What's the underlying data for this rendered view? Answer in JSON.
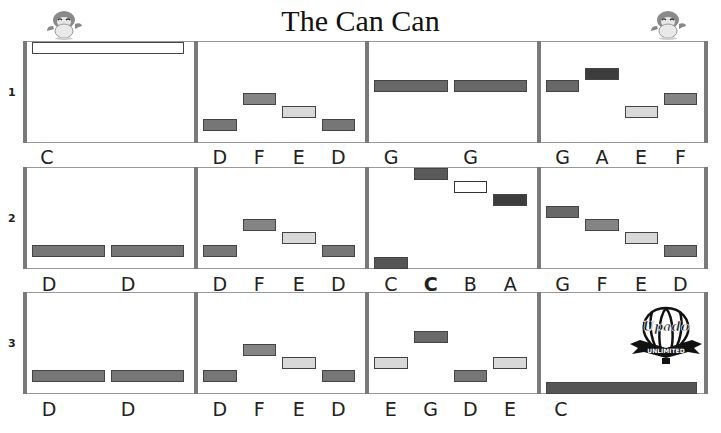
{
  "title": "The Can Can",
  "colors": {
    "C_low": "#555555",
    "D": "#767676",
    "E": "#d9d9d9",
    "F": "#848484",
    "G": "#686868",
    "A": "#3c3c3c",
    "B": "#ffffff",
    "C_high": "#5a5a5a"
  },
  "rows": [
    {
      "number": "1",
      "measures": [
        {
          "notes": [
            {
              "pitch": "C",
              "label": "C",
              "span": 4
            }
          ]
        },
        {
          "notes": [
            {
              "pitch": "D",
              "label": "D"
            },
            {
              "pitch": "F",
              "label": "F"
            },
            {
              "pitch": "E",
              "label": "E"
            },
            {
              "pitch": "D",
              "label": "D"
            }
          ]
        },
        {
          "notes": [
            {
              "pitch": "G",
              "label": "G",
              "span": 2
            },
            {
              "pitch": "G",
              "label": "G",
              "span": 2
            }
          ]
        },
        {
          "notes": [
            {
              "pitch": "G",
              "label": "G"
            },
            {
              "pitch": "A",
              "label": "A"
            },
            {
              "pitch": "E",
              "label": "E"
            },
            {
              "pitch": "F",
              "label": "F"
            }
          ]
        }
      ]
    },
    {
      "number": "2",
      "measures": [
        {
          "notes": [
            {
              "pitch": "D",
              "label": "D",
              "span": 2
            },
            {
              "pitch": "D",
              "label": "D",
              "span": 2
            }
          ]
        },
        {
          "notes": [
            {
              "pitch": "D",
              "label": "D"
            },
            {
              "pitch": "F",
              "label": "F"
            },
            {
              "pitch": "E",
              "label": "E"
            },
            {
              "pitch": "D",
              "label": "D"
            }
          ]
        },
        {
          "notes": [
            {
              "pitch": "C_low",
              "label": "C"
            },
            {
              "pitch": "C_high",
              "label": "C",
              "bold": true
            },
            {
              "pitch": "B",
              "label": "B"
            },
            {
              "pitch": "A",
              "label": "A"
            }
          ]
        },
        {
          "notes": [
            {
              "pitch": "G",
              "label": "G"
            },
            {
              "pitch": "F",
              "label": "F"
            },
            {
              "pitch": "E",
              "label": "E"
            },
            {
              "pitch": "D",
              "label": "D"
            }
          ]
        }
      ]
    },
    {
      "number": "3",
      "measures": [
        {
          "notes": [
            {
              "pitch": "D",
              "label": "D",
              "span": 2
            },
            {
              "pitch": "D",
              "label": "D",
              "span": 2
            }
          ]
        },
        {
          "notes": [
            {
              "pitch": "D",
              "label": "D"
            },
            {
              "pitch": "F",
              "label": "F"
            },
            {
              "pitch": "E",
              "label": "E"
            },
            {
              "pitch": "D",
              "label": "D"
            }
          ]
        },
        {
          "notes": [
            {
              "pitch": "E",
              "label": "E"
            },
            {
              "pitch": "G",
              "label": "G"
            },
            {
              "pitch": "D",
              "label": "D"
            },
            {
              "pitch": "E",
              "label": "E"
            }
          ]
        },
        {
          "notes": [
            {
              "pitch": "C_low",
              "label": "C",
              "span": 4
            }
          ]
        }
      ]
    }
  ],
  "logo": {
    "name": "Upado",
    "tagline": "UNLIMITED"
  }
}
